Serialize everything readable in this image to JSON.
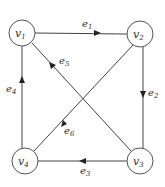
{
  "diagram": {
    "type": "directed-graph",
    "nodes": [
      {
        "id": "v1",
        "label": "v",
        "sub": "1",
        "x": 22,
        "y": 33
      },
      {
        "id": "v2",
        "label": "v",
        "sub": "2",
        "x": 140,
        "y": 34
      },
      {
        "id": "v3",
        "label": "v",
        "sub": "3",
        "x": 140,
        "y": 161
      },
      {
        "id": "v4",
        "label": "v",
        "sub": "4",
        "x": 25,
        "y": 161
      }
    ],
    "edges": [
      {
        "id": "e1",
        "label": "e",
        "sub": "1",
        "from": "v1",
        "to": "v2"
      },
      {
        "id": "e2",
        "label": "e",
        "sub": "2",
        "from": "v2",
        "to": "v3"
      },
      {
        "id": "e3",
        "label": "e",
        "sub": "3",
        "from": "v3",
        "to": "v4"
      },
      {
        "id": "e4",
        "label": "e",
        "sub": "4",
        "from": "v4",
        "to": "v1"
      },
      {
        "id": "e5",
        "label": "e",
        "sub": "5",
        "from": "v3",
        "to": "v1"
      },
      {
        "id": "e6",
        "label": "e",
        "sub": "6",
        "from": "v2",
        "to": "v4"
      }
    ]
  }
}
